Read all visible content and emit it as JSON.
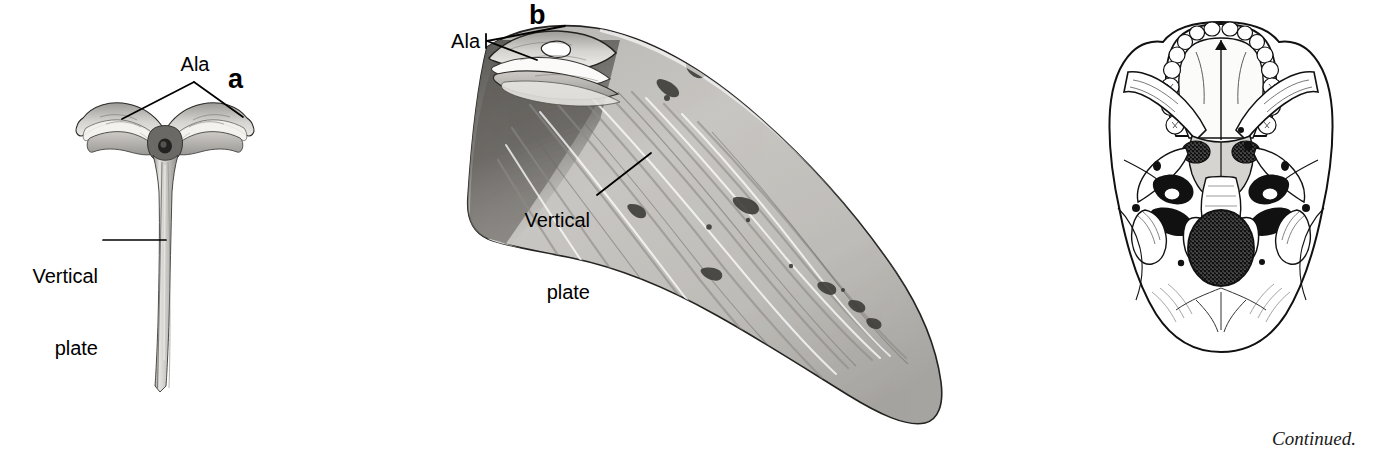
{
  "figure": {
    "background_color": "#ffffff",
    "ink_color": "#000000",
    "bone_fill_light": "#d8d6d2",
    "bone_fill_mid": "#b4b2ae",
    "bone_fill_dark": "#6e6c69",
    "bone_shadow": "#3a3936",
    "continued_note": "Continued."
  },
  "panels": [
    {
      "letter": "a",
      "name": "vomer-posterior-view",
      "labels": [
        {
          "text": "Ala",
          "pointer": "bracket-two-prong-down"
        },
        {
          "text": "Vertical\nplate",
          "pointer": "horizontal-leader-right"
        }
      ]
    },
    {
      "letter": "b",
      "name": "vomer-lateral-view",
      "labels": [
        {
          "text": "Ala",
          "pointer": "bracket-two-prong-right"
        },
        {
          "text": "Vertical\nplate",
          "pointer": "diagonal-leader-up-right"
        }
      ]
    },
    {
      "letter": "",
      "name": "skull-base-inferior-orientation-drawing",
      "labels": []
    }
  ],
  "labels": {
    "a_ala": "Ala",
    "a_vertical_plate_line1": "Vertical",
    "a_vertical_plate_line2": "plate",
    "a_letter": "a",
    "b_ala": "Ala",
    "b_vertical_plate_line1": "Vertical",
    "b_vertical_plate_line2": "plate",
    "b_letter": "b",
    "continued": "Continued."
  }
}
